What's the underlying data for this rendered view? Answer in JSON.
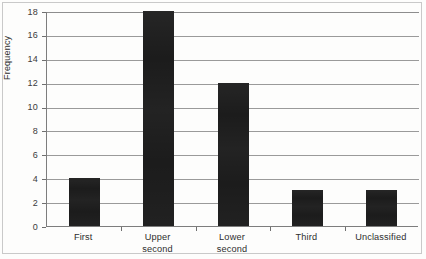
{
  "chart_data": {
    "type": "bar",
    "title": "",
    "subtitle": "",
    "xlabel": "",
    "ylabel": "Frequency",
    "categories": [
      "First",
      "Upper second",
      "Lower second",
      "Third",
      "Unclassified"
    ],
    "category_lines": [
      [
        "First"
      ],
      [
        "Upper",
        "second"
      ],
      [
        "Lower",
        "second"
      ],
      [
        "Third"
      ],
      [
        "Unclassified"
      ]
    ],
    "values": [
      4,
      18,
      12,
      3,
      3
    ],
    "ylim": [
      0,
      18
    ],
    "ytick_step": 2,
    "ytick_labels": [
      "0",
      "2",
      "4",
      "6",
      "8",
      "10",
      "12",
      "14",
      "16",
      "18"
    ],
    "ytick_values": [
      0,
      2,
      4,
      6,
      8,
      10,
      12,
      14,
      16,
      18
    ],
    "grid": "horizontal",
    "legend": "none",
    "annotations": [],
    "colors": {
      "bar": "#1c1c1c",
      "gridline": "#8d8d8d",
      "axis": "#7d7d7d",
      "text": "#2e2e2e",
      "frame": "#c9c9c9",
      "background": "#fdfdfc"
    }
  }
}
